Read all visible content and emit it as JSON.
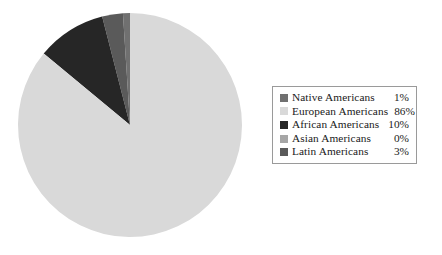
{
  "chart_data": {
    "type": "pie",
    "title": "",
    "subtitle": "",
    "xlabel": "",
    "ylabel": "",
    "grid": false,
    "legend_position": "right",
    "start_angle_deg": 90,
    "direction": "counterclockwise",
    "categories": [
      "Native Americans",
      "European Americans",
      "African Americans",
      "Asian Americans",
      "Latin Americans"
    ],
    "values": [
      1,
      86,
      10,
      0,
      3
    ],
    "value_labels": [
      "1%",
      "86%",
      "10%",
      "0%",
      "3%"
    ],
    "units": "percent",
    "total": 100,
    "colors": [
      "#707070",
      "#d9d9d9",
      "#262626",
      "#a6a6a6",
      "#5a5a5a"
    ],
    "slices": [
      {
        "label": "Native Americans",
        "value": 1,
        "display": "1%",
        "color": "#707070",
        "start_deg": 90.0,
        "sweep_deg": 3.6
      },
      {
        "label": "Latin Americans",
        "value": 3,
        "display": "3%",
        "color": "#5a5a5a",
        "start_deg": 93.6,
        "sweep_deg": 10.8
      },
      {
        "label": "African Americans",
        "value": 10,
        "display": "10%",
        "color": "#262626",
        "start_deg": 104.4,
        "sweep_deg": 36.0
      },
      {
        "label": "Asian Americans",
        "value": 0,
        "display": "0%",
        "color": "#a6a6a6",
        "start_deg": 140.4,
        "sweep_deg": 0.0
      },
      {
        "label": "European Americans",
        "value": 86,
        "display": "86%",
        "color": "#d9d9d9",
        "start_deg": 140.4,
        "sweep_deg": 309.6
      }
    ]
  },
  "legend": {
    "rows": [
      {
        "label": "Native Americans",
        "value": "1%",
        "color": "#707070"
      },
      {
        "label": "European Americans",
        "value": "86%",
        "color": "#d9d9d9"
      },
      {
        "label": "African Americans",
        "value": "10%",
        "color": "#262626"
      },
      {
        "label": "Asian Americans",
        "value": "0%",
        "color": "#a6a6a6"
      },
      {
        "label": "Latin Americans",
        "value": "3%",
        "color": "#5a5a5a"
      }
    ],
    "border_color": "#9a9a9a"
  },
  "pie": {
    "center_x": 113,
    "center_y": 113,
    "radius": 112,
    "outline_color": "#c9c9c9"
  }
}
